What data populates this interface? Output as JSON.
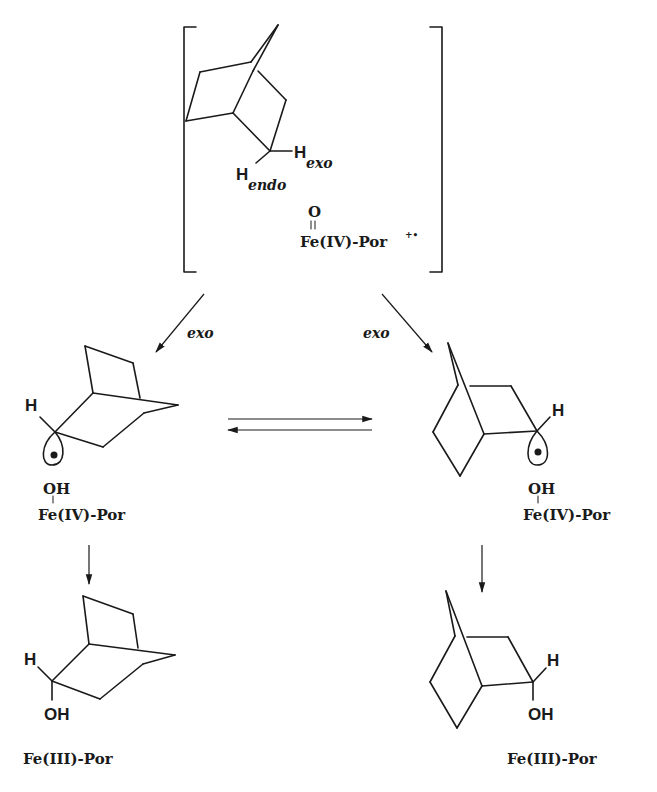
{
  "intermediate_complex": {
    "h_exo": {
      "H": "H",
      "sub": "exo"
    },
    "h_endo": {
      "H": "H",
      "sub": "endo"
    },
    "oxo": "O",
    "oxo_bond": "=",
    "iron_label": "Fe(IV)-Por",
    "iron_superscript": "+•"
  },
  "arrows": {
    "left_label": "exo",
    "right_label": "exo"
  },
  "left_radical": {
    "H": "H",
    "OH": "OH",
    "iron_label": "Fe(IV)-Por"
  },
  "right_radical": {
    "H": "H",
    "OH": "OH",
    "iron_label": "Fe(IV)-Por"
  },
  "left_product": {
    "H": "H",
    "OH": "OH",
    "iron_label": "Fe(III)-Por"
  },
  "right_product": {
    "H": "H",
    "OH": "OH",
    "iron_label": "Fe(III)-Por"
  }
}
